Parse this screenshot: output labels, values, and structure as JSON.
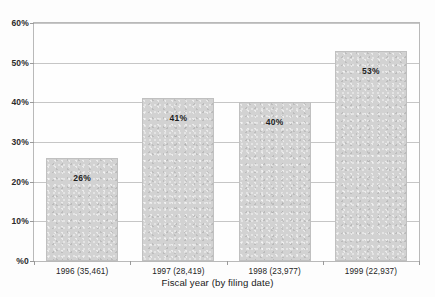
{
  "title_sliver": "",
  "chart_data": {
    "type": "bar",
    "title": "",
    "xlabel": "Fiscal year (by filing date)",
    "ylabel": "",
    "ylim": [
      0,
      60
    ],
    "grid": true,
    "legend": "none",
    "categories": [
      "1996 (35,461)",
      "1997 (28,419)",
      "1998 (23,977)",
      "1999 (22,937)"
    ],
    "values": [
      26,
      41,
      40,
      53
    ],
    "point_labels": [
      "26%",
      "41%",
      "40%",
      "53%"
    ],
    "ytick_labels": [
      "%0",
      "10%",
      "20%",
      "30%",
      "40%",
      "50%",
      "60%"
    ],
    "ytick_values": [
      0,
      10,
      20,
      30,
      40,
      50,
      60
    ],
    "colors": {
      "bar_fill": "#d2d2d2",
      "bar_border": "#c0c0c0",
      "gridline": "#c6c6c6",
      "frame": "#b9b9b9",
      "text": "#1e1e1e",
      "background": "#fdfdfd"
    }
  }
}
